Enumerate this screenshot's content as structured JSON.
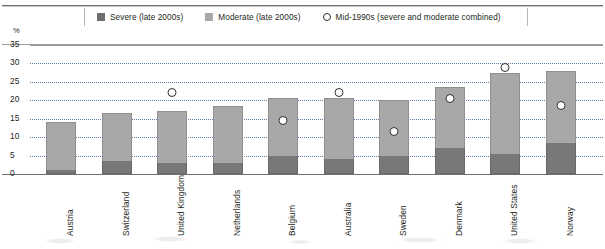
{
  "chart_data": {
    "type": "bar",
    "subtype": "stacked-bar-with-overlay-markers",
    "title": "",
    "xlabel": "",
    "ylabel": "%",
    "ylim": [
      0,
      35
    ],
    "yticks": [
      0,
      5,
      10,
      15,
      20,
      25,
      30,
      35
    ],
    "grid": true,
    "legend_position": "top",
    "categories": [
      "Austria",
      "Switzerland",
      "United Kingdom",
      "Netherlands",
      "Belgium",
      "Australia",
      "Sweden",
      "Denmark",
      "United States",
      "Norway"
    ],
    "series": [
      {
        "name": "Severe (late 2000s)",
        "type": "bar-segment",
        "color": "#787878",
        "values": [
          1.0,
          3.5,
          3.0,
          3.0,
          5.0,
          4.0,
          5.0,
          7.0,
          5.5,
          8.5
        ]
      },
      {
        "name": "Moderate (late 2000s)",
        "type": "bar-segment",
        "color": "#a8a8a8",
        "values": [
          13.0,
          13.0,
          14.0,
          15.5,
          15.5,
          16.5,
          15.0,
          16.5,
          22.0,
          19.5
        ]
      },
      {
        "name": "Mid-1990s (severe and moderate combined)",
        "type": "marker-circle",
        "color": "#ffffff",
        "values": [
          null,
          null,
          22.0,
          null,
          14.5,
          22.0,
          11.5,
          20.5,
          29.0,
          18.5
        ]
      }
    ],
    "totals_late_2000s": [
      14.0,
      16.5,
      17.0,
      18.5,
      20.5,
      20.5,
      20.0,
      23.5,
      27.5,
      28.0
    ]
  },
  "legend": {
    "items": [
      {
        "label": "Severe (late 2000s)",
        "marker": "square-dark",
        "color": "#6e6e6e"
      },
      {
        "label": "Moderate (late 2000s)",
        "marker": "square-light",
        "color": "#a8a8a8"
      },
      {
        "label": "Mid-1990s (severe and moderate combined)",
        "marker": "circle-open",
        "color": "#ffffff"
      }
    ]
  },
  "axis": {
    "unit_label": "%",
    "ytick_labels": [
      "35",
      "30",
      "25",
      "20",
      "15",
      "10",
      "5",
      "0"
    ]
  }
}
